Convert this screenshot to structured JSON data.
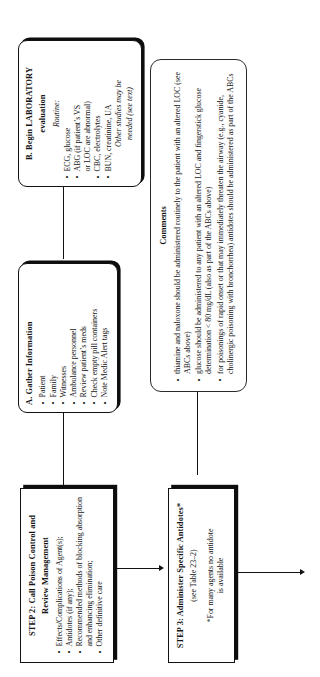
{
  "figure": {
    "orientation": "rotated-90-ccw",
    "type": "flowchart",
    "ink_color": "#121212",
    "page_color": "#ffffff"
  },
  "nodes": {
    "lab": {
      "title_line1": "B. Begin LABORATORY",
      "title_line2": "evaluation",
      "subhead": "Routine:",
      "bullets": [
        "ECG, glucose",
        "ABG (if patient’s VS",
        "or LOC are abnormal)",
        "CBC, electrolytes",
        "BUN, creatinine, UA"
      ],
      "bullet_marks": [
        true,
        true,
        false,
        true,
        true
      ],
      "italic_note_line1": "Other studies may be",
      "italic_note_line2": "needed (see text)"
    },
    "gather": {
      "title": "A. Gather Information",
      "bullets": [
        "Patient",
        "Family",
        "Witnesses",
        "Ambulance personnel",
        "Review patient’s meds",
        "Check empty pill containers",
        "Note Medic Alert tags"
      ]
    },
    "comments": {
      "title": "Comments",
      "bullets": [
        "thiamine and naloxone should be administered routinely to the patient with an altered LOC (see ABCs above)",
        "glucose should be administered to any patient with an altered LOC and fingerstick glucose determination < 80 mg/dL (also as part of the ABCs above)",
        "for poisonings of rapid onset or that may immediately threaten the airway (e.g., cyanide, cholinergic poisoning with bronchorrhea) antidotes should be administered as part of the ABCs"
      ]
    },
    "step2": {
      "title_line1": "STEP 2: Call Poison Control and",
      "title_line2": "Review Management",
      "bullets": [
        "Effects/Complications of Agent(s);",
        "Antidotes (if any);",
        "Recommended methods of blocking absorption and enhancing elimination;",
        "Other definitive care"
      ]
    },
    "step3": {
      "title": "STEP 3: Administer Specific Antidotes*",
      "reference": "(see Table 23–2)",
      "footnote_line1": "*For many agents no antidote",
      "footnote_line2": "is available"
    }
  },
  "connectors": [
    {
      "name": "gather-to-lab",
      "kind": "line"
    },
    {
      "name": "lab-to-step2",
      "kind": "line"
    },
    {
      "name": "comments-to-step3",
      "kind": "line"
    },
    {
      "name": "step2-to-step3",
      "kind": "arrow"
    },
    {
      "name": "step3-outflow",
      "kind": "arrow"
    }
  ]
}
